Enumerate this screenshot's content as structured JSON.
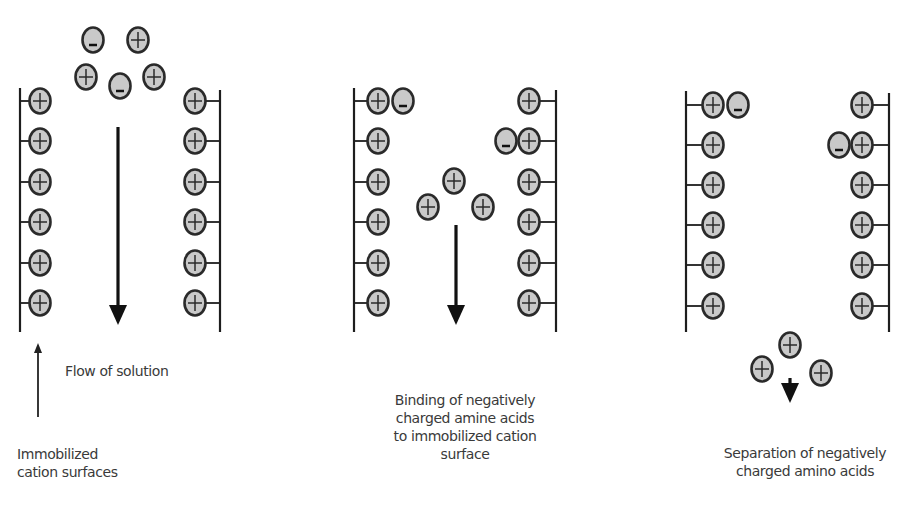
{
  "colors": {
    "line": "#1e1e1e",
    "ion_fill": "#c9c9c9",
    "ion_stroke": "#2a2a2a",
    "text": "#3a3a3a"
  },
  "panels": [
    {
      "id": "panel-1",
      "left_wall": {
        "x": 20,
        "y1": 88,
        "y2": 332
      },
      "right_wall": {
        "x": 220,
        "y1": 90,
        "y2": 332
      },
      "left_ions_y": [
        101,
        141,
        182,
        222,
        263,
        303
      ],
      "right_ions_y": [
        101,
        141,
        182,
        222,
        263,
        303
      ],
      "left_ion_x": 40,
      "right_ion_x": 195,
      "bound_negative": [],
      "free_ions": [
        {
          "x": 93,
          "y": 40,
          "charge": "-"
        },
        {
          "x": 138,
          "y": 40,
          "charge": "+"
        },
        {
          "x": 86,
          "y": 77,
          "charge": "+"
        },
        {
          "x": 120,
          "y": 86,
          "charge": "-"
        },
        {
          "x": 154,
          "y": 77,
          "charge": "+"
        }
      ],
      "arrow": {
        "x": 118,
        "y1": 127,
        "y2": 325
      }
    },
    {
      "id": "panel-2",
      "left_wall": {
        "x": 354,
        "y1": 88,
        "y2": 332
      },
      "right_wall": {
        "x": 556,
        "y1": 90,
        "y2": 332
      },
      "left_ions_y": [
        101,
        141,
        182,
        222,
        263,
        303
      ],
      "right_ions_y": [
        101,
        141,
        182,
        222,
        263,
        303
      ],
      "left_ion_x": 378,
      "right_ion_x": 529,
      "bound_negative": [
        {
          "x": 403,
          "y": 101,
          "charge": "-"
        },
        {
          "x": 506,
          "y": 141,
          "charge": "-"
        }
      ],
      "free_ions": [
        {
          "x": 454,
          "y": 181,
          "charge": "+"
        },
        {
          "x": 428,
          "y": 207,
          "charge": "+"
        },
        {
          "x": 483,
          "y": 207,
          "charge": "+"
        }
      ],
      "arrow": {
        "x": 456,
        "y1": 225,
        "y2": 325
      }
    },
    {
      "id": "panel-3",
      "left_wall": {
        "x": 686,
        "y1": 91,
        "y2": 332
      },
      "right_wall": {
        "x": 889,
        "y1": 93,
        "y2": 332
      },
      "left_ions_y": [
        105,
        145,
        185,
        225,
        265,
        306
      ],
      "right_ions_y": [
        105,
        145,
        185,
        225,
        265,
        306
      ],
      "left_ion_x": 713,
      "right_ion_x": 862,
      "bound_negative": [
        {
          "x": 738,
          "y": 105,
          "charge": "-"
        },
        {
          "x": 839,
          "y": 145,
          "charge": "-"
        }
      ],
      "free_ions": [
        {
          "x": 790,
          "y": 345,
          "charge": "+"
        },
        {
          "x": 762,
          "y": 369,
          "charge": "+"
        },
        {
          "x": 821,
          "y": 373,
          "charge": "+"
        }
      ],
      "arrow": {
        "x": 790,
        "y1": 378,
        "y2": 403
      }
    }
  ],
  "flow_arrow": {
    "x": 38,
    "y1": 417,
    "y2": 343
  },
  "labels": {
    "flow_of_solution": "Flow of solution",
    "immobilized_line1": "Immobilized",
    "immobilized_line2": "cation surfaces",
    "binding_line1": "Binding of negatively",
    "binding_line2": "charged amine acids",
    "binding_line3": "to immobilized cation",
    "binding_line4": "surface",
    "separation_line1": "Separation of negatively",
    "separation_line2": "charged amino acids"
  }
}
